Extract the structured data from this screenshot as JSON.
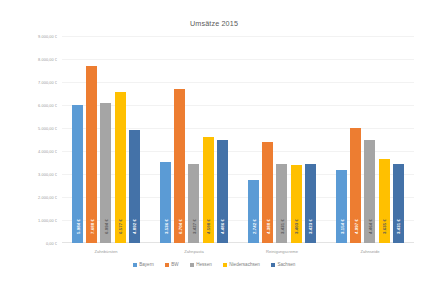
{
  "chart_data": {
    "type": "bar",
    "title": "Umsätze 2015",
    "xlabel": "",
    "ylabel": "",
    "ylim": [
      0,
      9000
    ],
    "grid": true,
    "legend_position": "bottom",
    "currency_suffix": " €",
    "y_ticks": [
      "9.000,00 €",
      "8.000,00 €",
      "7.000,00 €",
      "6.000,00 €",
      "5.000,00 €",
      "4.000,00 €",
      "3.000,00 €",
      "2.000,00 €",
      "1.000,00 €",
      "0,00 €"
    ],
    "y_tick_values": [
      9000,
      8000,
      7000,
      6000,
      5000,
      4000,
      3000,
      2000,
      1000,
      0
    ],
    "categories": [
      "Zahnbürsten",
      "Zahnpasta",
      "Reinigungscreme",
      "Zahnseide"
    ],
    "series": [
      {
        "name": "Bayern",
        "color": "#5B9BD5",
        "values": [
          5984,
          3536,
          2742,
          3154
        ],
        "labels": [
          "5.984 €",
          "3.536 €",
          "2.742 €",
          "3.154 €"
        ]
      },
      {
        "name": "BW",
        "color": "#ED7D31",
        "values": [
          7688,
          6704,
          4388,
          4997
        ],
        "labels": [
          "7.688 €",
          "6.704 €",
          "4.388 €",
          "4.997 €"
        ]
      },
      {
        "name": "Hessen",
        "color": "#A5A5A5",
        "values": [
          6094,
          3427,
          3431,
          4464
        ],
        "labels": [
          "6.094 €",
          "3.427 €",
          "3.431 €",
          "4.464 €"
        ]
      },
      {
        "name": "Niedersachsen",
        "color": "#FFC000",
        "values": [
          6577,
          4598,
          3403,
          3635
        ],
        "labels": [
          "6.577 €",
          "4.598 €",
          "3.403 €",
          "3.635 €"
        ]
      },
      {
        "name": "Sachsen",
        "color": "#4472A8",
        "values": [
          4892,
          4486,
          3423,
          3431
        ],
        "labels": [
          "4.892 €",
          "4.486 €",
          "3.423 €",
          "3.431 €"
        ]
      }
    ]
  }
}
